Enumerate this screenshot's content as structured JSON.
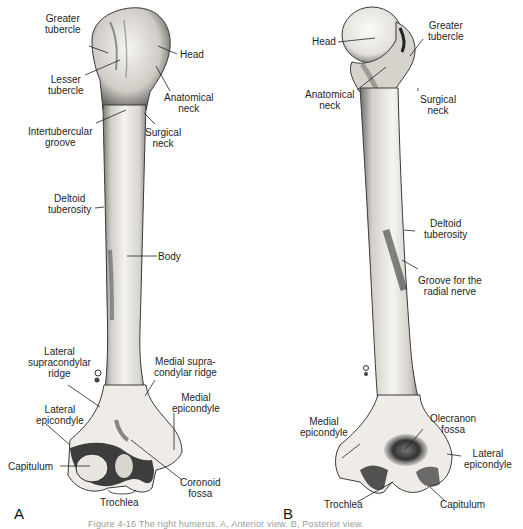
{
  "figure": {
    "caption": "Figure 4-16  The right humerus. A, Anterior view. B, Posterior view.",
    "panels": [
      {
        "letter": "A",
        "view": "anterior",
        "labels": {
          "greater_tubercle": "Greater\ntubercle",
          "head": "Head",
          "lesser_tubercle": "Lesser\ntubercle",
          "anatomical_neck": "Anatomical\nneck",
          "intertubercular_groove": "Intertubercular\ngroove",
          "surgical_neck": "Surgical\nneck",
          "deltoid_tuberosity": "Deltoid\ntuberosity",
          "body": "Body",
          "lateral_supracondylar_ridge": "Lateral\nsupracondylar\nridge",
          "medial_supracondylar_ridge": "Medial supra-\ncondylar ridge",
          "medial_epicondyle": "Medial\nepicondyle",
          "lateral_epicondyle": "Lateral\nepicondyle",
          "capitulum": "Capitulum",
          "coronoid_fossa": "Coronoid\nfossa",
          "trochlea": "Trochlea"
        }
      },
      {
        "letter": "B",
        "view": "posterior",
        "labels": {
          "head": "Head",
          "greater_tubercle": "Greater\ntubercle",
          "anatomical_neck": "Anatomical\nneck",
          "surgical_neck": "Surgical\nneck",
          "deltoid_tuberosity": "Deltoid\ntuberosity",
          "groove_radial_nerve": "Groove for the\nradial nerve",
          "medial_epicondyle": "Medial\nepicondyle",
          "olecranon_fossa": "Olecranon\nfossa",
          "lateral_epicondyle": "Lateral\nepicondyle",
          "trochlea": "Trochlea",
          "capitulum": "Capitulum"
        }
      }
    ]
  },
  "colors": {
    "background": "#ffffff",
    "bone_fill": "#f2f0ec",
    "bone_shade": "#9c9a96",
    "bone_dark": "#2a2a2a",
    "leader_line": "#222222",
    "text": "#1e1e1e"
  }
}
